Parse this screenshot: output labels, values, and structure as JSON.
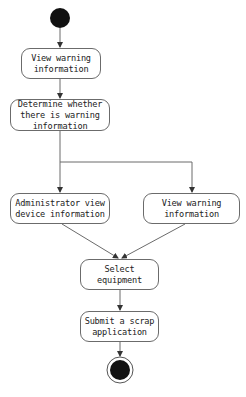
{
  "diagram": {
    "type": "UML activity diagram",
    "start": {
      "label": "initial node"
    },
    "end": {
      "label": "final node"
    },
    "nodes": [
      {
        "id": "n1",
        "text": "View warning\ninformation"
      },
      {
        "id": "n2",
        "text": "Determine whether\nthere is warning\ninformation"
      },
      {
        "id": "n3",
        "text": "Administrator view\ndevice information"
      },
      {
        "id": "n4",
        "text": "View warning\ninformation"
      },
      {
        "id": "n5",
        "text": "Select equipment"
      },
      {
        "id": "n6",
        "text": "Submit a scrap\napplication"
      }
    ],
    "edges": [
      {
        "from": "start",
        "to": "n1"
      },
      {
        "from": "n1",
        "to": "n2"
      },
      {
        "from": "n2",
        "to": "n3"
      },
      {
        "from": "n2",
        "to": "n4"
      },
      {
        "from": "n3",
        "to": "n5"
      },
      {
        "from": "n4",
        "to": "n5"
      },
      {
        "from": "n5",
        "to": "n6"
      },
      {
        "from": "n6",
        "to": "end"
      }
    ],
    "colors": {
      "line": "#6b6b6b",
      "fill": "#111111",
      "background": "#ffffff"
    }
  }
}
